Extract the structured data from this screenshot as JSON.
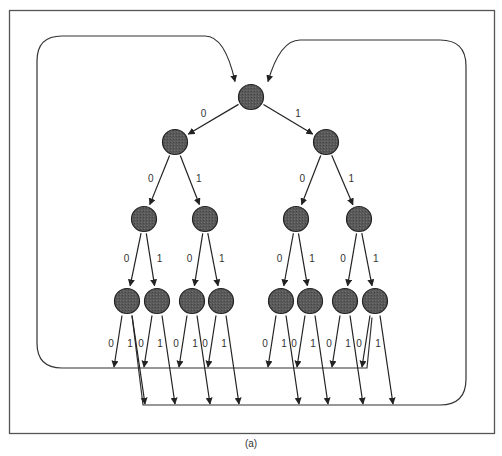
{
  "figure": {
    "caption": "(a)",
    "frame": {
      "x": 9,
      "y": 10,
      "w": 486,
      "h": 424,
      "stroke": "#555555"
    },
    "colors": {
      "node_fill": "#5a5a5a",
      "node_stroke": "#222222",
      "line": "#333333",
      "label": "#333333"
    },
    "edge_labels": {
      "zero": "0",
      "one": "1"
    },
    "node_radius": 12.5,
    "levels": [
      [
        {
          "id": "n0",
          "x": 251,
          "y": 97
        }
      ],
      [
        {
          "id": "n00",
          "x": 175,
          "y": 142
        },
        {
          "id": "n01",
          "x": 326,
          "y": 142
        }
      ],
      [
        {
          "id": "n000",
          "x": 144,
          "y": 219
        },
        {
          "id": "n001",
          "x": 205,
          "y": 219
        },
        {
          "id": "n010",
          "x": 296,
          "y": 219
        },
        {
          "id": "n011",
          "x": 359,
          "y": 219
        }
      ],
      [
        {
          "id": "n0000",
          "x": 127,
          "y": 301
        },
        {
          "id": "n0001",
          "x": 157,
          "y": 301
        },
        {
          "id": "n0010",
          "x": 192,
          "y": 301
        },
        {
          "id": "n0011",
          "x": 221,
          "y": 301
        },
        {
          "id": "n0100",
          "x": 281,
          "y": 301
        },
        {
          "id": "n0101",
          "x": 310,
          "y": 301
        },
        {
          "id": "n0110",
          "x": 345,
          "y": 301
        },
        {
          "id": "n0111",
          "x": 375,
          "y": 301
        }
      ]
    ],
    "feedback_loops": [
      {
        "name": "zero-feedback",
        "description": "All 0-outputs of the bottom level feed back to the root via the left loop",
        "bus_y": 368
      },
      {
        "name": "one-feedback",
        "description": "All 1-outputs of the bottom level feed back to the root via the right loop",
        "bus_y": 405
      }
    ]
  }
}
